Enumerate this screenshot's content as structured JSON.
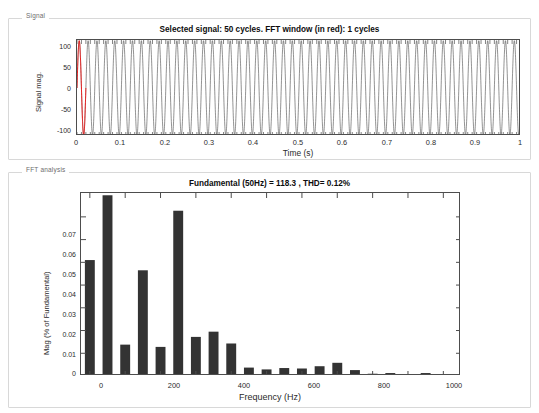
{
  "panels": {
    "signal": {
      "label": "Signal"
    },
    "fft": {
      "label": "FFT analysis"
    }
  },
  "signal_plot": {
    "title": "Selected signal: 50 cycles. FFT window (in red): 1 cycles",
    "ylabel": "Signal mag.",
    "xlabel": "Time (s)",
    "yticks": [
      "100",
      "50",
      "0",
      "-50",
      "-100"
    ],
    "xticks": [
      "0",
      "0.1",
      "0.2",
      "0.3",
      "0.4",
      "0.5",
      "0.6",
      "0.7",
      "0.8",
      "0.9",
      "1"
    ],
    "trace_color": "#4a4a4a",
    "window_color": "#ff0000"
  },
  "fft_plot": {
    "title": "Fundamental (50Hz) = 118.3 , THD= 0.12%",
    "ylabel": "Mag (% of Fundamental)",
    "xlabel": "Frequency (Hz)",
    "yticks": [
      "0",
      "0.01",
      "0.02",
      "0.03",
      "0.04",
      "0.05",
      "0.06",
      "0.07"
    ],
    "xticks": [
      "0",
      "200",
      "400",
      "600",
      "800",
      "1000"
    ],
    "bar_color": "#333333"
  },
  "chart_data": [
    {
      "type": "line",
      "title": "Selected signal: 50 cycles. FFT window (in red): 1 cycles",
      "xlabel": "Time (s)",
      "ylabel": "Signal mag.",
      "xlim": [
        0,
        1
      ],
      "ylim": [
        -120,
        120
      ],
      "yticks": [
        100,
        50,
        0,
        -50,
        -100
      ],
      "xticks": [
        0,
        0.1,
        0.2,
        0.3,
        0.4,
        0.5,
        0.6,
        0.7,
        0.8,
        0.9,
        1
      ],
      "grid": false,
      "legend": "none",
      "series": [
        {
          "name": "signal",
          "description": "50 Hz sinusoid, 50 cycles over 1 s, amplitude approximately 118",
          "frequency_hz": 50,
          "cycles": 50,
          "amplitude": 118.3
        },
        {
          "name": "FFT window (in red)",
          "description": "1 cycle highlighted in red at start of record",
          "cycles": 1
        }
      ]
    },
    {
      "type": "bar",
      "title": "Fundamental (50Hz) = 118.3 , THD= 0.12%",
      "xlabel": "Frequency (Hz)",
      "ylabel": "Mag (% of Fundamental)",
      "xlim": [
        -25,
        1050
      ],
      "ylim": [
        0,
        0.0805
      ],
      "yticks": [
        0,
        0.01,
        0.02,
        0.03,
        0.04,
        0.05,
        0.06,
        0.07
      ],
      "xticks": [
        0,
        200,
        400,
        600,
        800,
        1000
      ],
      "grid": false,
      "legend": "none",
      "categories": [
        0,
        50,
        100,
        150,
        200,
        250,
        300,
        350,
        400,
        450,
        500,
        550,
        600,
        650,
        700,
        750,
        800,
        850,
        900,
        950,
        1000
      ],
      "values": [
        0.051,
        0.0795,
        0.0138,
        0.0465,
        0.0128,
        0.0727,
        0.0172,
        0.0195,
        0.0143,
        0.0037,
        0.0029,
        0.0035,
        0.0033,
        0.0043,
        0.0058,
        0.0026,
        0.001,
        0.0013,
        0.0004,
        0.0013,
        0.0003
      ]
    }
  ]
}
